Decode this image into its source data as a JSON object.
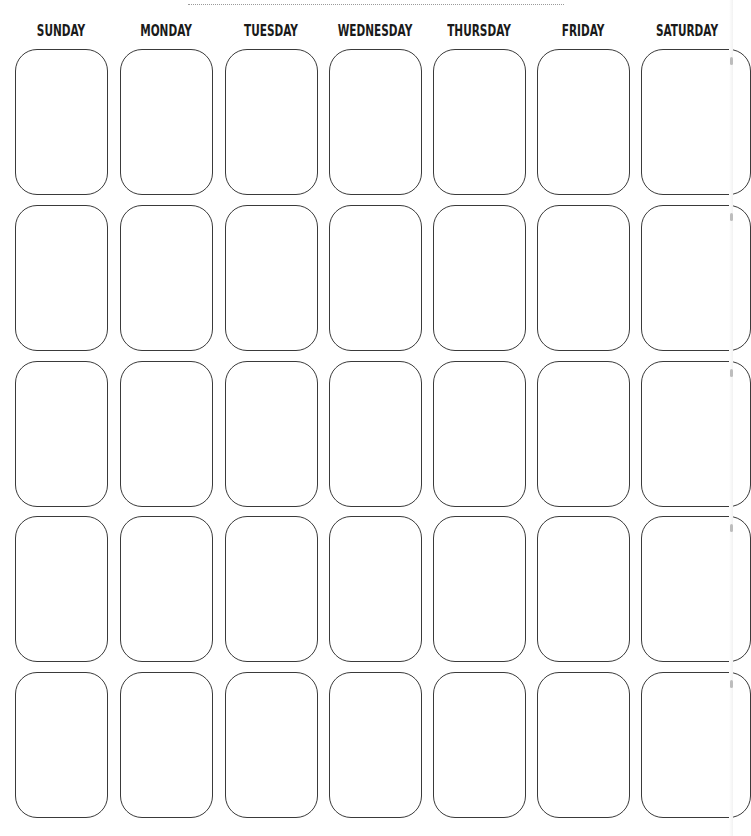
{
  "calendar": {
    "days": [
      "SUNDAY",
      "MONDAY",
      "TUESDAY",
      "WEDNESDAY",
      "THURSDAY",
      "FRIDAY",
      "SATURDAY"
    ],
    "rows": 5,
    "cells_per_row": 7,
    "cell_contents": [
      [
        "",
        "",
        "",
        "",
        "",
        "",
        ""
      ],
      [
        "",
        "",
        "",
        "",
        "",
        "",
        ""
      ],
      [
        "",
        "",
        "",
        "",
        "",
        "",
        ""
      ],
      [
        "",
        "",
        "",
        "",
        "",
        "",
        ""
      ],
      [
        "",
        "",
        "",
        "",
        "",
        "",
        ""
      ]
    ]
  },
  "colors": {
    "border": "#3a3a3a",
    "text": "#1a1a1a",
    "background": "#ffffff",
    "dotted_line": "#9a9a9a"
  }
}
